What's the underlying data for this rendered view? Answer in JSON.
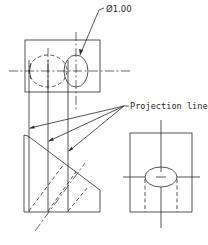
{
  "diagram": {
    "type": "orthographic-projection-drawing",
    "views": [
      {
        "name": "top-view",
        "features": [
          "rectangle outline",
          "hidden cylinder (dashed ellipse)",
          "through hole ellipse",
          "center lines"
        ]
      },
      {
        "name": "side-view",
        "features": [
          "triangular profile",
          "hidden hole lines (dashed diagonals)",
          "center line"
        ]
      },
      {
        "name": "front-view",
        "features": [
          "rectangle outline",
          "elliptical hole",
          "hidden hole lines",
          "center lines"
        ]
      }
    ],
    "annotations": {
      "diameter_label": "Ø1.00",
      "projection_label": "Projection lines"
    },
    "colors": {
      "line": "#2a2a2a",
      "background": "#ffffff"
    }
  }
}
